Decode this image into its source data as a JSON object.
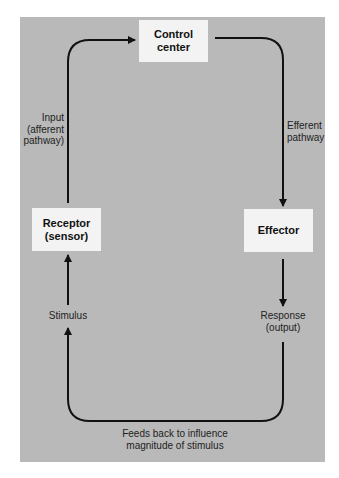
{
  "diagram": {
    "type": "homeostatic feedback loop",
    "colors": {
      "background": "#ffffff",
      "panel": "#b9b9b9",
      "box": "#f3f3f3",
      "arrow": "#111111"
    },
    "nodes": {
      "control_center": {
        "line1": "Control",
        "line2": "center"
      },
      "receptor": {
        "line1": "Receptor",
        "line2": "(sensor)"
      },
      "effector": {
        "label": "Effector"
      }
    },
    "labels": {
      "input": {
        "line1": "Input",
        "line2": "(afferent",
        "line3": "pathway)"
      },
      "efferent": {
        "line1": "Efferent",
        "line2": "pathway"
      },
      "stimulus": "Stimulus",
      "response": {
        "line1": "Response",
        "line2": "(output)"
      },
      "feedback": {
        "line1": "Feeds back to influence",
        "line2": "magnitude of stimulus"
      }
    },
    "edges": [
      {
        "from": "receptor",
        "to": "control_center",
        "label": "Input (afferent pathway)"
      },
      {
        "from": "control_center",
        "to": "effector",
        "label": "Efferent pathway"
      },
      {
        "from": "effector",
        "to": "response",
        "label": "Response (output)"
      },
      {
        "from": "response",
        "to": "stimulus",
        "label": "Feeds back to influence magnitude of stimulus"
      },
      {
        "from": "stimulus",
        "to": "receptor",
        "label": "Stimulus"
      }
    ]
  }
}
